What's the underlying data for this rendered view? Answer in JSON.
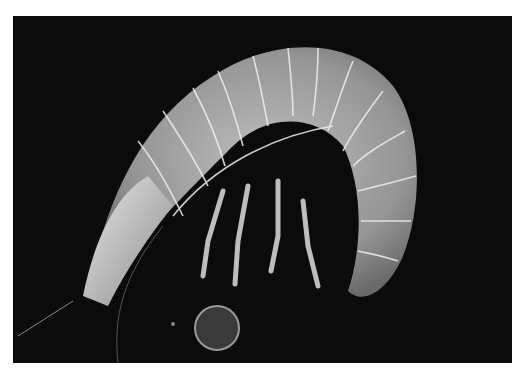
{
  "image": {
    "subject": "Micrograph of an amphipod crustacean curled in a C shape",
    "alt": "Grayscale micrograph of a curled amphipod with segmented body, legs and antenna on a black background, with a small round bubble below",
    "colors": {
      "border": "#ffffff",
      "background": "#0b0b0b",
      "body_light": "#d8d8d8",
      "body_mid": "#a8a8a8",
      "segment_lines": "#f2f2f2"
    }
  }
}
